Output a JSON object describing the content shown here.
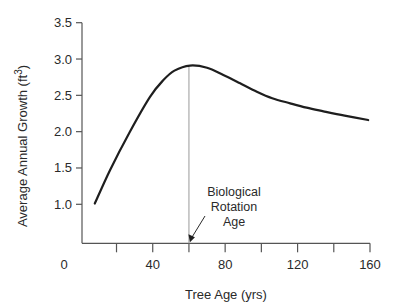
{
  "chart_data": {
    "type": "line",
    "title": "",
    "xlabel": "Tree Age (yrs)",
    "ylabel": "Average Annual Growth (ft",
    "ylabel_superscript": "3",
    "ylabel_suffix": ")",
    "xlim": [
      0,
      160
    ],
    "ylim": [
      0.47,
      3.5
    ],
    "x_ticks": [
      20,
      40,
      60,
      80,
      100,
      120,
      140,
      160
    ],
    "x_tick_labels": [
      {
        "value": 0,
        "label": "0"
      },
      {
        "value": 40,
        "label": "40"
      },
      {
        "value": 80,
        "label": "80"
      },
      {
        "value": 120,
        "label": "120"
      },
      {
        "value": 160,
        "label": "160"
      }
    ],
    "y_ticks": [
      1.0,
      1.5,
      2.0,
      2.5,
      3.0,
      3.5
    ],
    "y_tick_labels": [
      "1.0",
      "1.5",
      "2.0",
      "2.5",
      "3.0",
      "3.5"
    ],
    "grid": false,
    "legend": null,
    "series": [
      {
        "name": "Average Annual Growth",
        "color": "#1e1e1e",
        "x": [
          8,
          16.4,
          27.4,
          38.5,
          45.9,
          52,
          60.6,
          70,
          79,
          88,
          97.5,
          106,
          115.9,
          125,
          134.3,
          146,
          159
        ],
        "y": [
          1.01,
          1.47,
          2.0,
          2.48,
          2.71,
          2.84,
          2.91,
          2.88,
          2.78,
          2.67,
          2.55,
          2.46,
          2.39,
          2.33,
          2.28,
          2.22,
          2.16
        ]
      }
    ],
    "reference_line": {
      "x": 60,
      "color": "#9a9a9a"
    },
    "annotation": {
      "lines": [
        "Biological",
        "Rotation",
        "Age"
      ],
      "points_to_x": 60
    }
  }
}
